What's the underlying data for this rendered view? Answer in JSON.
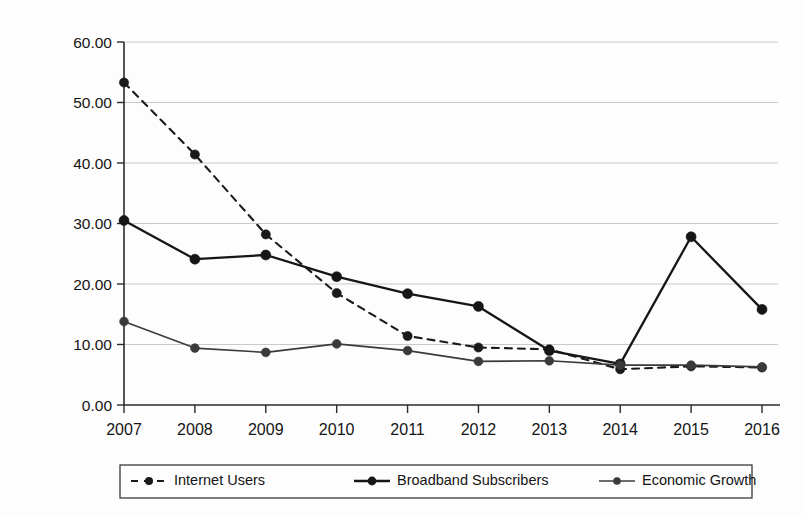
{
  "chart_data": {
    "type": "line",
    "title": "",
    "xlabel": "",
    "ylabel": "",
    "categories": [
      "2007",
      "2008",
      "2009",
      "2010",
      "2011",
      "2012",
      "2013",
      "2014",
      "2015",
      "2016"
    ],
    "ylim": [
      0,
      60
    ],
    "ytick_values": [
      0,
      10,
      20,
      30,
      40,
      50,
      60
    ],
    "ytick_labels": [
      "0.00",
      "10.00",
      "20.00",
      "30.00",
      "40.00",
      "50.00",
      "60.00"
    ],
    "grid": "horizontal",
    "legend_position": "bottom",
    "series": [
      {
        "name": "Internet Users",
        "style": "dashed",
        "marker": "filled-circle",
        "color": "#1a1a1a",
        "values": [
          53.3,
          41.4,
          28.2,
          18.5,
          11.4,
          9.5,
          9.2,
          5.9,
          6.4,
          6.2
        ]
      },
      {
        "name": "Broadband Subscribers",
        "style": "solid-thick",
        "marker": "filled-circle",
        "color": "#161616",
        "values": [
          30.5,
          24.1,
          24.8,
          21.2,
          18.4,
          16.3,
          9.0,
          6.8,
          27.8,
          15.8
        ]
      },
      {
        "name": "Economic Growth",
        "style": "solid-thin",
        "marker": "filled-circle",
        "color": "#3a3a3a",
        "values": [
          13.8,
          9.4,
          8.7,
          10.1,
          9.0,
          7.2,
          7.3,
          6.6,
          6.6,
          6.3
        ]
      }
    ]
  },
  "legend": {
    "entries": [
      {
        "label": "Internet Users",
        "sample": "dashed-line-marker"
      },
      {
        "label": "Broadband Subscribers",
        "sample": "thick-line-marker"
      },
      {
        "label": "Economic Growth",
        "sample": "thin-line-marker"
      }
    ]
  },
  "colors": {
    "axis": "#2a2a2a",
    "grid": "#c9c9c9",
    "internet_users": "#1a1a1a",
    "broadband": "#161616",
    "economic_growth": "#3a3a3a",
    "background": "#fdfdfd"
  }
}
